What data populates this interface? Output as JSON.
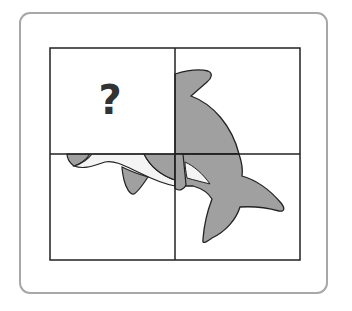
{
  "puzzle": {
    "missing_piece_label": "?",
    "grid": {
      "rows": 2,
      "cols": 2
    },
    "pieces": [
      {
        "position": "top-left",
        "state": "missing"
      },
      {
        "position": "top-right",
        "state": "dolphin-head-fin"
      },
      {
        "position": "bottom-left",
        "state": "dolphin-snout-flipper"
      },
      {
        "position": "bottom-right",
        "state": "dolphin-tail"
      }
    ],
    "subject": "dolphin",
    "colors": {
      "dolphin_body": "#a0a0a0",
      "dolphin_belly": "#f4f4f4",
      "grid_line": "#222222",
      "card_border": "#a8a8a8"
    }
  }
}
